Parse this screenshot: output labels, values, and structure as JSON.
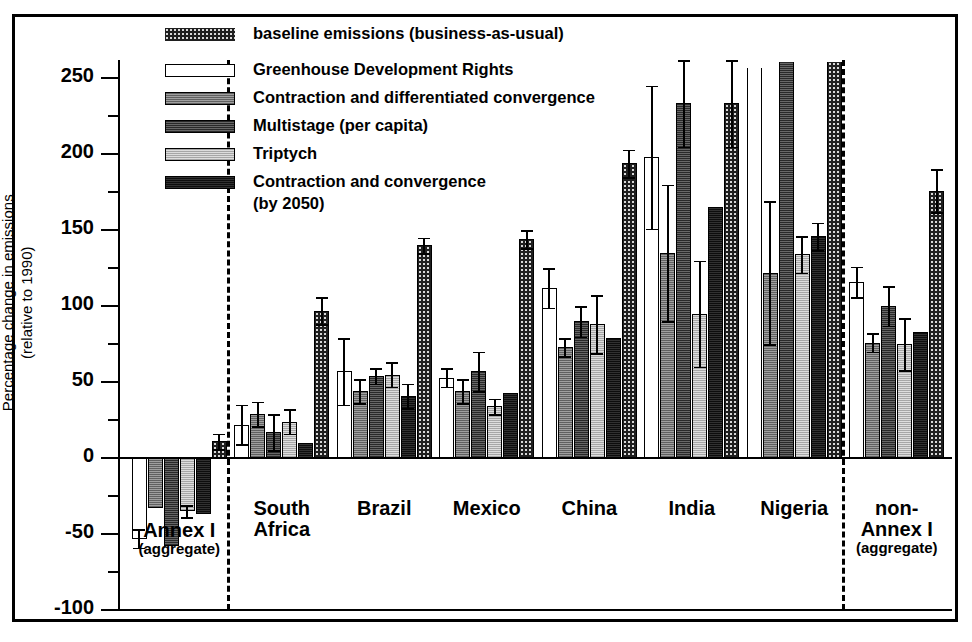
{
  "chart": {
    "type": "bar",
    "title": "",
    "ylabel_line1": "Percentage change in emissions",
    "ylabel_line2": "(relative to 1990)",
    "xlabel": ""
  },
  "axis": {
    "ylim": [
      -100,
      262
    ],
    "yticks": [
      "250",
      "200",
      "150",
      "100",
      "50",
      "0",
      "-50",
      "-100"
    ],
    "ytick_values": [
      250,
      200,
      150,
      100,
      50,
      0,
      -50,
      -100
    ],
    "minor_tick_step": 25,
    "grid": "off"
  },
  "legend": {
    "position": "top-center-inside",
    "items": [
      {
        "label": "baseline emissions (business-as-usual)",
        "swatch": "checkered",
        "key": "baseline"
      },
      {
        "label": "Greenhouse Development Rights",
        "swatch": "white",
        "key": "gdr"
      },
      {
        "label": "Contraction and differentiated convergence",
        "swatch": "medium-gray",
        "key": "cdc"
      },
      {
        "label": "Multistage (per capita)",
        "swatch": "dark-gray",
        "key": "multistage"
      },
      {
        "label": "Triptych",
        "swatch": "light-gray",
        "key": "triptych"
      },
      {
        "label": "Contraction and convergence",
        "swatch": "black",
        "key": "cc"
      },
      {
        "label": "(by 2050)",
        "swatch": "none",
        "key": "cc_cont"
      }
    ]
  },
  "chart_data": {
    "type": "bar",
    "title": "",
    "xlabel": "",
    "ylabel": "Percentage change in emissions (relative to 1990)",
    "ylim": [
      -100,
      262
    ],
    "yticks": [
      -100,
      -50,
      0,
      50,
      100,
      150,
      200,
      250
    ],
    "grid": false,
    "legend_position": "top-center-inside",
    "categories": [
      "Annex I (aggregate)",
      "South Africa",
      "Brazil",
      "Mexico",
      "China",
      "India",
      "Nigeria",
      "non-Annex I (aggregate)"
    ],
    "series": [
      {
        "name": "Greenhouse Development Rights",
        "values": [
          -53,
          22,
          57,
          53,
          112,
          198,
          257,
          116
        ],
        "errors": [
          6,
          13,
          22,
          6,
          13,
          47,
          47,
          10
        ],
        "clipped": [
          false,
          false,
          false,
          false,
          false,
          false,
          true,
          false
        ]
      },
      {
        "name": "Contraction and differentiated convergence",
        "values": [
          -33,
          29,
          44,
          44,
          73,
          135,
          122,
          76
        ],
        "errors": [
          0,
          8,
          8,
          8,
          6,
          45,
          47,
          6
        ],
        "clipped": [
          false,
          false,
          false,
          false,
          false,
          false,
          false,
          false
        ]
      },
      {
        "name": "Multistage (per capita)",
        "values": [
          -58,
          17,
          54,
          57,
          90,
          234,
          261,
          100
        ],
        "errors": [
          0,
          12,
          5,
          13,
          10,
          29,
          45,
          13
        ],
        "clipped": [
          false,
          false,
          false,
          false,
          false,
          false,
          true,
          false
        ]
      },
      {
        "name": "Triptych",
        "values": [
          -35,
          24,
          55,
          34,
          88,
          95,
          134,
          75
        ],
        "errors": [
          4,
          8,
          8,
          5,
          19,
          35,
          12,
          17
        ],
        "clipped": [
          false,
          false,
          false,
          false,
          false,
          false,
          false,
          false
        ]
      },
      {
        "name": "Contraction and convergence (by 2050)",
        "values": [
          -37,
          10,
          41,
          43,
          79,
          165,
          146,
          83
        ],
        "errors": [
          0,
          0,
          8,
          0,
          0,
          0,
          9,
          0
        ],
        "clipped": [
          false,
          false,
          false,
          false,
          false,
          false,
          false,
          false
        ]
      },
      {
        "name": "baseline emissions (business-as-usual)",
        "values": [
          11,
          97,
          140,
          144,
          194,
          234,
          261,
          176
        ],
        "errors": [
          5,
          9,
          5,
          6,
          9,
          29,
          45,
          14
        ],
        "clipped": [
          false,
          false,
          false,
          false,
          false,
          false,
          true,
          false
        ]
      }
    ],
    "series_order_in_group": [
      "Greenhouse Development Rights",
      "Contraction and differentiated convergence",
      "Multistage (per capita)",
      "Triptych",
      "Contraction and convergence (by 2050)",
      "baseline emissions (business-as-usual)"
    ],
    "group_separators_after": [
      "Annex I (aggregate)",
      "Nigeria"
    ]
  },
  "groups": [
    {
      "label": "Annex I",
      "sub": "(aggregate)"
    },
    {
      "label": "South",
      "sub": "Africa"
    },
    {
      "label": "Brazil",
      "sub": ""
    },
    {
      "label": "Mexico",
      "sub": ""
    },
    {
      "label": "China",
      "sub": ""
    },
    {
      "label": "India",
      "sub": ""
    },
    {
      "label": "Nigeria",
      "sub": ""
    },
    {
      "label": "non-",
      "sub": "Annex I",
      "sub2": "(aggregate)"
    }
  ],
  "colors": {
    "baseline": "#d8d8d8",
    "gdr": "#ffffff",
    "cdc": "#8a8a8a",
    "multistage": "#4a4a4a",
    "triptych": "#c6c6c6",
    "cc": "#1a1a1a",
    "axis": "#000000"
  }
}
